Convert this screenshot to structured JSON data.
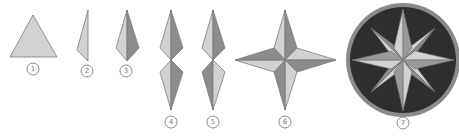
{
  "diagram": {
    "colors": {
      "light_face": "#d2d2d2",
      "dark_face": "#8c8c8c",
      "outline": "#7a7a7a",
      "circle_fill": "#2e2e2e",
      "circle_rim": "#8a8a8a",
      "background": "#ffffff"
    },
    "steps": [
      {
        "number": "1",
        "label": "1",
        "description": "Equilateral triangle"
      },
      {
        "number": "2",
        "label": "2",
        "description": "Half kite (narrow triangle)"
      },
      {
        "number": "3",
        "label": "3",
        "description": "Kite with light and dark halves"
      },
      {
        "number": "4",
        "label": "4",
        "description": "Two kites joined tip to tip"
      },
      {
        "number": "5",
        "label": "5",
        "description": "Two kites with lower shading flipped"
      },
      {
        "number": "6",
        "label": "6",
        "description": "Four-point star"
      },
      {
        "number": "7",
        "label": "7",
        "description": "Eight-point compass star in dark circle"
      }
    ]
  }
}
